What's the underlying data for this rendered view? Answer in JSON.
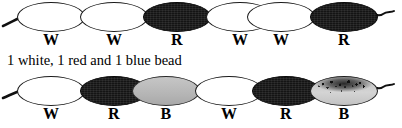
{
  "figure": {
    "caption": "1 white, 1 red and 1 blue bead",
    "colors": {
      "white_bead": "#ffffff",
      "red_bead": "#141414",
      "blue_bead": "#bcbcbc",
      "outline": "#1a1a1a",
      "text": "#000000",
      "background": "#ffffff"
    },
    "strands": [
      {
        "name": "strand-top",
        "beads": [
          {
            "label": "W",
            "kind": "white"
          },
          {
            "label": "W",
            "kind": "white"
          },
          {
            "label": "R",
            "kind": "red"
          },
          {
            "label": "W",
            "kind": "white"
          },
          {
            "label": "W",
            "kind": "white"
          },
          {
            "label": "R",
            "kind": "red"
          }
        ]
      },
      {
        "name": "strand-bottom",
        "beads": [
          {
            "label": "W",
            "kind": "white"
          },
          {
            "label": "R",
            "kind": "red"
          },
          {
            "label": "B",
            "kind": "blue"
          },
          {
            "label": "W",
            "kind": "white"
          },
          {
            "label": "R",
            "kind": "red"
          },
          {
            "label": "B",
            "kind": "blue-speckled"
          }
        ]
      }
    ]
  }
}
